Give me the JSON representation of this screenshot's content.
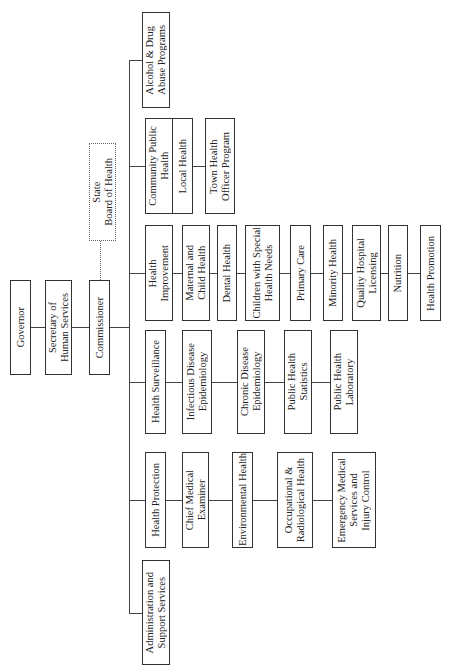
{
  "chart_title": "",
  "top": {
    "governor": "Governor",
    "secretary": "Secretary of\nHuman Services",
    "commissioner": "Commissioner",
    "board": "State\nBoard of Health"
  },
  "divisions": [
    {
      "label": "Administration and\nSupport Services",
      "children": []
    },
    {
      "label": "Health Protection",
      "children": [
        "Chief Medical\nExaminer",
        "Environmental Health",
        "Occupational &\nRadiological Health",
        "Emergency Medical\nServices and\nInjury Control"
      ]
    },
    {
      "label": "Health Surveillance",
      "children": [
        "Infectious Disease\nEpidemiology",
        "Chronic Disease\nEpidemiology",
        "Public Health\nStatistics",
        "Public Health\nLaboratory"
      ]
    },
    {
      "label": "Health\nImprovement",
      "children": [
        "Maternal and\nChild Health",
        "Dental Health",
        "Children with Special\nHealth Needs",
        "Primary Care",
        "Minority Health",
        "Quality Hospital\nLicensing",
        "Nutrition",
        "Health Promotion"
      ]
    },
    {
      "label": "Community Public\nHealth",
      "children": [
        "Local Health",
        "Town Health\nOfficer Program"
      ]
    },
    {
      "label": "Alcohol & Drug\nAbuse Programs",
      "children": []
    }
  ]
}
